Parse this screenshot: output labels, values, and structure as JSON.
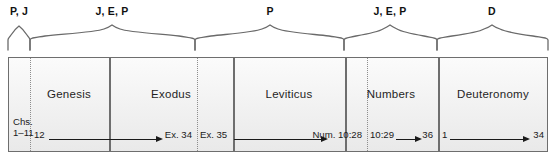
{
  "diagram": {
    "width": 558,
    "height": 160,
    "colors": {
      "cell_fill": "#f1f1f1",
      "border": "#6e6e6e",
      "dotted_divider": "#8d8d8d",
      "text": "#1a1a1a",
      "arrow": "#1a1a1a"
    }
  },
  "source_brackets": [
    {
      "label": "P, J",
      "start_x": 8,
      "end_x": 30,
      "center_x": 19
    },
    {
      "label": "J, E, P",
      "start_x": 30,
      "end_x": 195,
      "center_x": 112
    },
    {
      "label": "P",
      "start_x": 195,
      "end_x": 344,
      "center_x": 270
    },
    {
      "label": "J, E, P",
      "start_x": 344,
      "end_x": 437,
      "center_x": 390
    },
    {
      "label": "D",
      "start_x": 437,
      "end_x": 548,
      "center_x": 492
    }
  ],
  "books": [
    {
      "name": "Genesis",
      "center_x": 68
    },
    {
      "name": "Exodus",
      "center_x": 170
    },
    {
      "name": "Leviticus",
      "center_x": 288
    },
    {
      "name": "Numbers",
      "center_x": 390
    },
    {
      "name": "Deuteronomy",
      "center_x": 492
    }
  ],
  "dividers": {
    "solid_x": [
      108,
      232,
      344,
      437
    ],
    "dotted_x": [
      29,
      196,
      366
    ]
  },
  "references": [
    {
      "id": "genesis-1-11",
      "line1": "Chs.",
      "line2": "1–11",
      "x": 13,
      "type": "two-line"
    },
    {
      "id": "genesis-start",
      "text": "12",
      "x": 34,
      "type": "start"
    },
    {
      "id": "exodus-34-end",
      "text": "Ex. 34",
      "x": 192,
      "type": "end"
    },
    {
      "id": "exodus-35-start",
      "text": "Ex. 35",
      "x": 200,
      "type": "start"
    },
    {
      "id": "numbers-1028-end",
      "text": "Num. 10:28",
      "x": 362,
      "type": "end"
    },
    {
      "id": "numbers-1029-start",
      "text": "10:29",
      "x": 370,
      "type": "start"
    },
    {
      "id": "numbers-36-end",
      "text": "36",
      "x": 433,
      "type": "end"
    },
    {
      "id": "deut-1-start",
      "text": "1",
      "x": 442,
      "type": "start"
    },
    {
      "id": "deut-34-end",
      "text": "34",
      "x": 544,
      "type": "end"
    }
  ],
  "arrows": [
    {
      "id": "arrow-genesis-exodus",
      "start_x": 49,
      "width": 114
    },
    {
      "id": "arrow-exodus-numbers",
      "start_x": 234,
      "width": 94
    },
    {
      "id": "arrow-numbers",
      "start_x": 396,
      "width": 26
    },
    {
      "id": "arrow-deuteronomy",
      "start_x": 450,
      "width": 80
    }
  ]
}
